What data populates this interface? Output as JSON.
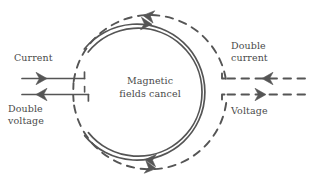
{
  "figure": {
    "background_color": "#ffffff",
    "stroke_color": "#555555",
    "text_color": "#4a4a4a"
  },
  "center_note": {
    "text": "Magnetic\nfields cancel"
  },
  "labels": {
    "current": "Current",
    "double_voltage": "Double\nvoltage",
    "double_current": "Double\ncurrent",
    "voltage": "Voltage"
  },
  "leads": {
    "left_top": {
      "label": "Current",
      "style": "solid",
      "arrow": "right"
    },
    "left_bottom": {
      "label": "Double voltage",
      "style": "solid",
      "arrow": "left"
    },
    "right_top": {
      "label": "Double current",
      "style": "dashed",
      "arrow": "left"
    },
    "right_bottom": {
      "label": "Voltage",
      "style": "dashed",
      "arrow": "right"
    }
  },
  "coils": {
    "inner": {
      "style": "solid-double",
      "arrow_top": "right",
      "arrow_bottom": "left"
    },
    "outer": {
      "style": "dashed",
      "arrow_top": "left",
      "arrow_bottom": "right"
    }
  },
  "geometry": {
    "center_x": 150,
    "center_y": 92,
    "inner_radius": 68,
    "outer_radius": 77
  }
}
